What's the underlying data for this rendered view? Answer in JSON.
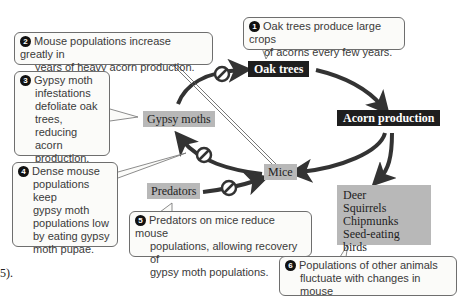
{
  "nodes": {
    "oak_trees": "Oak trees",
    "acorn_production": "Acorn production",
    "gypsy_moths": "Gypsy moths",
    "mice": "Mice",
    "predators": "Predators",
    "other_animals": [
      "Deer",
      "Squirrels",
      "Chipmunks",
      "Seed-eating birds"
    ]
  },
  "callouts": [
    {
      "number": "1",
      "lines": [
        "Oak trees produce large crops",
        "of acorns every few years."
      ]
    },
    {
      "number": "2",
      "lines": [
        "Mouse populations increase greatly in",
        "years of heavy acorn production."
      ]
    },
    {
      "number": "3",
      "lines": [
        "Gypsy moth",
        "infestations",
        "defoliate oak",
        "trees, reducing",
        "acorn",
        "production."
      ]
    },
    {
      "number": "4",
      "lines": [
        "Dense mouse",
        "populations keep",
        "gypsy moth",
        "populations low",
        "by eating gypsy",
        "moth pupae."
      ]
    },
    {
      "number": "5",
      "lines": [
        "Predators on mice reduce mouse",
        "populations, allowing recovery of",
        "gypsy moth populations."
      ]
    },
    {
      "number": "6",
      "lines": [
        "Populations of other animals",
        "fluctuate with changes in mouse"
      ]
    }
  ],
  "edges": [
    {
      "from": "Oak trees",
      "to": "Acorn production",
      "type": "positive"
    },
    {
      "from": "Acorn production",
      "to": "Mice",
      "type": "positive"
    },
    {
      "from": "Acorn production",
      "to": "Other animals",
      "type": "positive"
    },
    {
      "from": "Mice",
      "to": "Gypsy moths",
      "type": "inhibitory"
    },
    {
      "from": "Gypsy moths",
      "to": "Oak trees",
      "type": "inhibitory"
    },
    {
      "from": "Predators",
      "to": "Mice",
      "type": "inhibitory"
    }
  ],
  "page_fragment": "5).",
  "colors": {
    "dark_label_bg": "#1e1e1e",
    "grey_label_bg": "#b8b8b8",
    "arrow": "#333333",
    "callout_border": "#6e6e6e"
  }
}
